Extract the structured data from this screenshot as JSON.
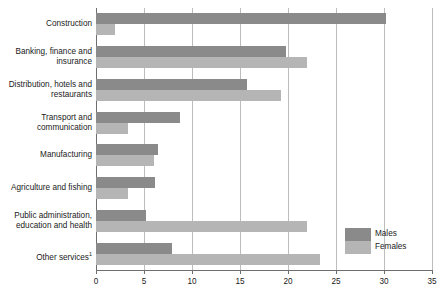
{
  "chart_data": {
    "type": "bar",
    "orientation": "horizontal",
    "title": "",
    "xlabel": "",
    "ylabel": "",
    "xlim": [
      0,
      35
    ],
    "xticks": [
      0,
      5,
      10,
      15,
      20,
      25,
      30,
      35
    ],
    "grid": "vertical",
    "legend_position": "bottom-right",
    "categories": [
      "Construction",
      "Banking, finance and insurance",
      "Distribution, hotels and restaurants",
      "Transport and communication",
      "Manufacturing",
      "Agriculture and fishing",
      "Public administration, education and health",
      "Other services"
    ],
    "series": [
      {
        "name": "Males",
        "color": "#8a8a8a",
        "values": [
          30.2,
          19.8,
          15.7,
          8.8,
          6.5,
          6.1,
          5.2,
          7.9
        ]
      },
      {
        "name": "Females",
        "color": "#b5b5b5",
        "values": [
          2.0,
          22.0,
          19.3,
          3.3,
          6.0,
          3.3,
          22.0,
          23.3
        ]
      }
    ]
  },
  "axis": {
    "tick_labels": [
      "0",
      "5",
      "10",
      "15",
      "20",
      "25",
      "30",
      "35"
    ]
  },
  "category_labels": [
    {
      "line1": "Construction",
      "line2": "",
      "footnote": ""
    },
    {
      "line1": "Banking, finance and",
      "line2": "insurance",
      "footnote": ""
    },
    {
      "line1": "Distribution, hotels and",
      "line2": "restaurants",
      "footnote": ""
    },
    {
      "line1": "Transport and",
      "line2": "communication",
      "footnote": ""
    },
    {
      "line1": "Manufacturing",
      "line2": "",
      "footnote": ""
    },
    {
      "line1": "Agriculture and fishing",
      "line2": "",
      "footnote": ""
    },
    {
      "line1": "Public administration,",
      "line2": "education and health",
      "footnote": ""
    },
    {
      "line1": "Other services",
      "line2": "",
      "footnote": "1"
    }
  ],
  "legend": {
    "items": [
      {
        "label": "Males",
        "color": "#8a8a8a"
      },
      {
        "label": "Females",
        "color": "#b5b5b5"
      }
    ]
  }
}
